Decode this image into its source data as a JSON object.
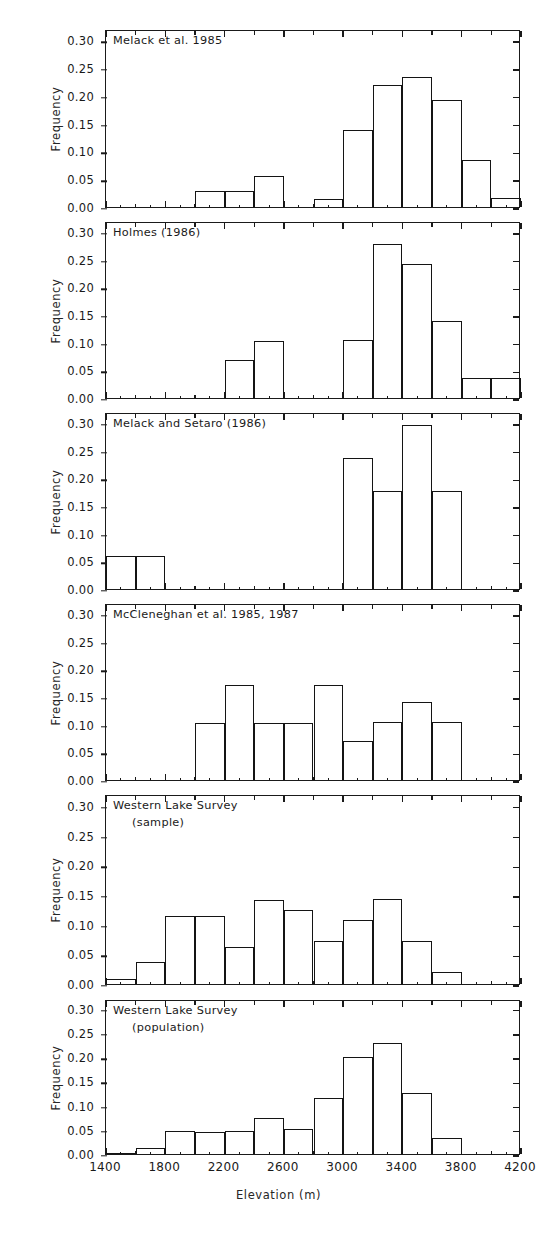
{
  "figure": {
    "axis_title_x": "Elevation  (m)",
    "axis_title_y": "Frequency",
    "line_color": "#1a1a1a"
  },
  "chart_data": {
    "type": "bar",
    "title": "",
    "xlabel": "Elevation  (m)",
    "ylabel": "Frequency",
    "xlim": [
      1400,
      4200
    ],
    "ylim": [
      0.0,
      0.32
    ],
    "bin_width": 200,
    "grid": false,
    "legend": null,
    "x_major_ticks": [
      1400,
      1800,
      2200,
      2600,
      3000,
      3400,
      3800,
      4200
    ],
    "x_minor_ticks": [
      1600,
      2000,
      2400,
      2800,
      3200,
      3600,
      4000
    ],
    "x_tick_labels": [
      "1400",
      "1800",
      "2200",
      "2600",
      "3000",
      "3400",
      "3800",
      "4200"
    ],
    "y_ticks": [
      0.0,
      0.05,
      0.1,
      0.15,
      0.2,
      0.25,
      0.3
    ],
    "y_tick_labels": [
      "0.00",
      "0.05",
      "0.10",
      "0.15",
      "0.20",
      "0.25",
      "0.30"
    ],
    "panels": [
      {
        "id": "melack-1985",
        "title": "Melack et al. 1985",
        "title_line2": "",
        "bins": [
          {
            "x0": 2000,
            "x1": 2200,
            "value": 0.028
          },
          {
            "x0": 2200,
            "x1": 2400,
            "value": 0.028
          },
          {
            "x0": 2400,
            "x1": 2600,
            "value": 0.055
          },
          {
            "x0": 2800,
            "x1": 3000,
            "value": 0.015
          },
          {
            "x0": 3000,
            "x1": 3200,
            "value": 0.138
          },
          {
            "x0": 3200,
            "x1": 3400,
            "value": 0.219
          },
          {
            "x0": 3400,
            "x1": 3600,
            "value": 0.233
          },
          {
            "x0": 3600,
            "x1": 3800,
            "value": 0.193
          },
          {
            "x0": 3800,
            "x1": 4000,
            "value": 0.084
          },
          {
            "x0": 4000,
            "x1": 4200,
            "value": 0.017
          }
        ]
      },
      {
        "id": "holmes-1986",
        "title": "Holmes (1986)",
        "title_line2": "",
        "bins": [
          {
            "x0": 2200,
            "x1": 2400,
            "value": 0.069
          },
          {
            "x0": 2400,
            "x1": 2600,
            "value": 0.103
          },
          {
            "x0": 3000,
            "x1": 3200,
            "value": 0.104
          },
          {
            "x0": 3200,
            "x1": 3400,
            "value": 0.278
          },
          {
            "x0": 3400,
            "x1": 3600,
            "value": 0.242
          },
          {
            "x0": 3600,
            "x1": 3800,
            "value": 0.14
          },
          {
            "x0": 3800,
            "x1": 4000,
            "value": 0.036
          },
          {
            "x0": 4000,
            "x1": 4200,
            "value": 0.036
          }
        ]
      },
      {
        "id": "melack-setaro-1986",
        "title": "Melack and Setaro (1986)",
        "title_line2": "",
        "bins": [
          {
            "x0": 1400,
            "x1": 1600,
            "value": 0.059
          },
          {
            "x0": 1600,
            "x1": 1800,
            "value": 0.059
          },
          {
            "x0": 3000,
            "x1": 3200,
            "value": 0.236
          },
          {
            "x0": 3200,
            "x1": 3400,
            "value": 0.178
          },
          {
            "x0": 3400,
            "x1": 3600,
            "value": 0.296
          },
          {
            "x0": 3600,
            "x1": 3800,
            "value": 0.178
          }
        ]
      },
      {
        "id": "mccleneghan-1985-1987",
        "title": "McCleneghan et al. 1985, 1987",
        "title_line2": "",
        "bins": [
          {
            "x0": 2000,
            "x1": 2200,
            "value": 0.103
          },
          {
            "x0": 2200,
            "x1": 2400,
            "value": 0.172
          },
          {
            "x0": 2400,
            "x1": 2600,
            "value": 0.103
          },
          {
            "x0": 2600,
            "x1": 2800,
            "value": 0.103
          },
          {
            "x0": 2800,
            "x1": 3000,
            "value": 0.172
          },
          {
            "x0": 3000,
            "x1": 3200,
            "value": 0.07
          },
          {
            "x0": 3200,
            "x1": 3400,
            "value": 0.104
          },
          {
            "x0": 3400,
            "x1": 3600,
            "value": 0.141
          },
          {
            "x0": 3600,
            "x1": 3800,
            "value": 0.104
          }
        ]
      },
      {
        "id": "western-lake-survey-sample",
        "title": "Western Lake Survey",
        "title_line2": "(sample)",
        "bins": [
          {
            "x0": 1400,
            "x1": 1600,
            "value": 0.008
          },
          {
            "x0": 1600,
            "x1": 1800,
            "value": 0.037
          },
          {
            "x0": 1800,
            "x1": 2000,
            "value": 0.114
          },
          {
            "x0": 2000,
            "x1": 2200,
            "value": 0.114
          },
          {
            "x0": 2200,
            "x1": 2400,
            "value": 0.063
          },
          {
            "x0": 2400,
            "x1": 2600,
            "value": 0.142
          },
          {
            "x0": 2600,
            "x1": 2800,
            "value": 0.124
          },
          {
            "x0": 2800,
            "x1": 3000,
            "value": 0.072
          },
          {
            "x0": 3000,
            "x1": 3200,
            "value": 0.107
          },
          {
            "x0": 3200,
            "x1": 3400,
            "value": 0.143
          },
          {
            "x0": 3400,
            "x1": 3600,
            "value": 0.072
          },
          {
            "x0": 3600,
            "x1": 3800,
            "value": 0.021
          }
        ]
      },
      {
        "id": "western-lake-survey-population",
        "title": "Western Lake Survey",
        "title_line2": "(population)",
        "bins": [
          {
            "x0": 1400,
            "x1": 1600,
            "value": 0.003
          },
          {
            "x0": 1600,
            "x1": 1800,
            "value": 0.013
          },
          {
            "x0": 1800,
            "x1": 2000,
            "value": 0.047
          },
          {
            "x0": 2000,
            "x1": 2200,
            "value": 0.046
          },
          {
            "x0": 2200,
            "x1": 2400,
            "value": 0.047
          },
          {
            "x0": 2400,
            "x1": 2600,
            "value": 0.074
          },
          {
            "x0": 2600,
            "x1": 2800,
            "value": 0.052
          },
          {
            "x0": 2800,
            "x1": 3000,
            "value": 0.115
          },
          {
            "x0": 3000,
            "x1": 3200,
            "value": 0.2
          },
          {
            "x0": 3200,
            "x1": 3400,
            "value": 0.229
          },
          {
            "x0": 3400,
            "x1": 3600,
            "value": 0.125
          },
          {
            "x0": 3600,
            "x1": 3800,
            "value": 0.033
          }
        ]
      }
    ]
  }
}
